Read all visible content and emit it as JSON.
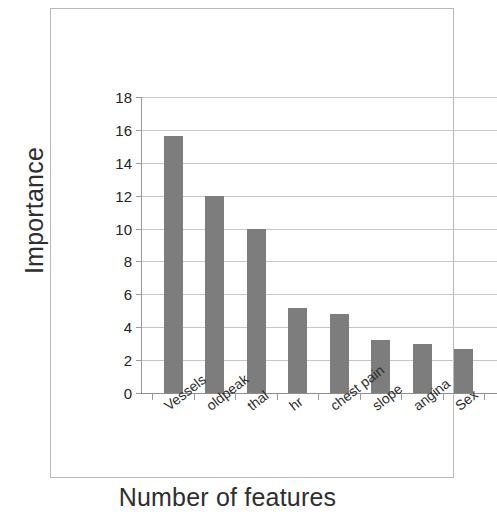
{
  "chart_data": {
    "type": "bar",
    "title": "",
    "xlabel": "Number of features",
    "ylabel": "Importance",
    "categories": [
      "Vessels",
      "oldpeak",
      "thal",
      "hr",
      "chest pain",
      "slope",
      "angina",
      "Sex"
    ],
    "values": [
      15.6,
      12.0,
      10.0,
      5.2,
      4.8,
      3.2,
      3.0,
      2.7
    ],
    "ylim": [
      0,
      18
    ],
    "ytick_labels": [
      "18",
      "16",
      "14",
      "12",
      "10",
      "8",
      "6",
      "4",
      "2",
      "0"
    ],
    "ytick_values": [
      18,
      16,
      14,
      12,
      10,
      8,
      6,
      4,
      2,
      0
    ],
    "ytick_step": 2,
    "grid": "horizontal",
    "legend": "none",
    "bar_color": "#7d7d7d",
    "gridline_color": "#c6c6c6",
    "axis_color": "#9a9a9a",
    "background_color": "#ffffff",
    "xtick_label_rotation": -38
  }
}
